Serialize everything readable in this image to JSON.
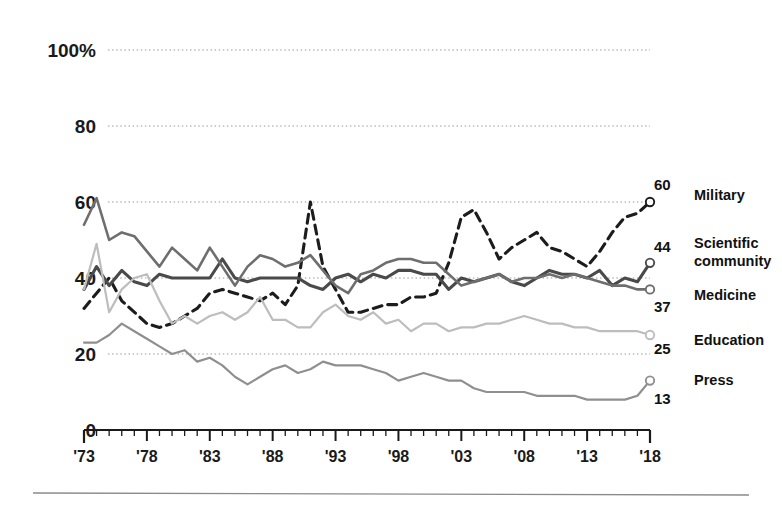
{
  "chart_data": {
    "type": "line",
    "title": "",
    "subtitle": "",
    "xlabel": "",
    "ylabel": "",
    "grid": true,
    "gridlines": [
      20,
      40,
      60,
      80,
      100
    ],
    "legend_position": "right-inline",
    "xlim": [
      1973,
      2018
    ],
    "ylim": [
      0,
      100
    ],
    "y_ticks": [
      "0",
      "20",
      "40",
      "60",
      "80",
      "100%"
    ],
    "y_tick_values": [
      0,
      20,
      40,
      60,
      80,
      100
    ],
    "x_ticks": [
      "'73",
      "'78",
      "'83",
      "'88",
      "'93",
      "'98",
      "'03",
      "'08",
      "'13",
      "'18"
    ],
    "x_tick_values": [
      1973,
      1978,
      1983,
      1988,
      1993,
      1998,
      2003,
      2008,
      2013,
      2018
    ],
    "x_minor_step": 1,
    "x": [
      1973,
      1974,
      1975,
      1976,
      1977,
      1978,
      1979,
      1980,
      1981,
      1982,
      1983,
      1984,
      1985,
      1986,
      1987,
      1988,
      1989,
      1990,
      1991,
      1992,
      1993,
      1994,
      1995,
      1996,
      1997,
      1998,
      1999,
      2000,
      2001,
      2002,
      2003,
      2004,
      2005,
      2006,
      2007,
      2008,
      2009,
      2010,
      2011,
      2012,
      2013,
      2014,
      2015,
      2016,
      2017,
      2018
    ],
    "series": [
      {
        "name": "Military",
        "end_value": 60,
        "style": "dashed",
        "color": "#1c1c1c",
        "width": 3.1,
        "values": [
          32,
          36,
          40,
          34,
          31,
          28,
          27,
          28,
          30,
          32,
          36,
          37,
          36,
          35,
          34,
          36,
          33,
          38,
          60,
          43,
          37,
          31,
          31,
          32,
          33,
          33,
          35,
          35,
          36,
          44,
          56,
          58,
          52,
          45,
          48,
          50,
          52,
          48,
          47,
          45,
          43,
          47,
          52,
          56,
          57,
          60
        ]
      },
      {
        "name": "Scientific community",
        "end_value": 44,
        "style": "solid",
        "color": "#4a4a4a",
        "width": 3.1,
        "values": [
          37,
          43,
          38,
          42,
          39,
          38,
          41,
          40,
          40,
          40,
          40,
          45,
          40,
          39,
          40,
          40,
          40,
          40,
          38,
          37,
          40,
          41,
          39,
          41,
          40,
          42,
          42,
          41,
          41,
          37,
          40,
          39,
          40,
          41,
          39,
          38,
          40,
          42,
          41,
          41,
          40,
          42,
          38,
          40,
          39,
          44
        ]
      },
      {
        "name": "Medicine",
        "end_value": 37,
        "style": "solid",
        "color": "#6e6e6e",
        "width": 2.6,
        "values": [
          54,
          61,
          50,
          52,
          51,
          47,
          43,
          48,
          45,
          42,
          48,
          43,
          38,
          43,
          46,
          45,
          43,
          44,
          46,
          42,
          38,
          36,
          41,
          42,
          44,
          45,
          45,
          44,
          44,
          41,
          38,
          39,
          40,
          41,
          39,
          40,
          40,
          41,
          40,
          41,
          40,
          39,
          38,
          38,
          37,
          37
        ]
      },
      {
        "name": "Education",
        "end_value": 25,
        "style": "solid",
        "color": "#bdbdbd",
        "width": 2.2,
        "values": [
          37,
          49,
          31,
          37,
          40,
          41,
          34,
          28,
          30,
          28,
          30,
          31,
          29,
          31,
          35,
          29,
          29,
          27,
          27,
          31,
          33,
          30,
          29,
          31,
          28,
          29,
          26,
          28,
          28,
          26,
          27,
          27,
          28,
          28,
          29,
          30,
          29,
          28,
          28,
          27,
          27,
          26,
          26,
          26,
          26,
          25
        ]
      },
      {
        "name": "Press",
        "end_value": 13,
        "style": "solid",
        "color": "#8f8f8f",
        "width": 2.2,
        "values": [
          23,
          23,
          25,
          28,
          26,
          24,
          22,
          20,
          21,
          18,
          19,
          17,
          14,
          12,
          14,
          16,
          17,
          15,
          16,
          18,
          17,
          17,
          17,
          16,
          15,
          13,
          14,
          15,
          14,
          13,
          13,
          11,
          10,
          10,
          10,
          10,
          9,
          9,
          9,
          9,
          8,
          8,
          8,
          8,
          9,
          13
        ]
      }
    ]
  },
  "axis": {
    "y_labels": [
      {
        "text": "100%",
        "value": 100
      },
      {
        "text": "80",
        "value": 80
      },
      {
        "text": "60",
        "value": 60
      },
      {
        "text": "40",
        "value": 40
      },
      {
        "text": "20",
        "value": 20
      },
      {
        "text": "0",
        "value": 0
      }
    ],
    "x_labels": [
      {
        "text": "'73",
        "value": 1973
      },
      {
        "text": "'78",
        "value": 1978
      },
      {
        "text": "'83",
        "value": 1983
      },
      {
        "text": "'88",
        "value": 1988
      },
      {
        "text": "'93",
        "value": 1993
      },
      {
        "text": "'98",
        "value": 1998
      },
      {
        "text": "'03",
        "value": 2003
      },
      {
        "text": "'08",
        "value": 2008
      },
      {
        "text": "'13",
        "value": 2013
      },
      {
        "text": "'18",
        "value": 2018
      }
    ]
  },
  "legend": [
    {
      "label": "Military",
      "value": "60"
    },
    {
      "label": "Scientific",
      "label2": "community",
      "value": "44"
    },
    {
      "label": "Medicine",
      "value": "37"
    },
    {
      "label": "Education",
      "value": "25"
    },
    {
      "label": "Press",
      "value": "13"
    }
  ],
  "colors": {
    "axis": "#1a1a1a",
    "grid": "#9a9a9a",
    "rule": "#8a8a8a",
    "background": "#ffffff"
  }
}
